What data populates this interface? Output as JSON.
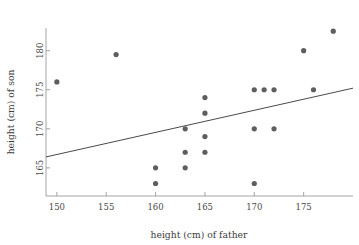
{
  "chart_data": {
    "type": "scatter",
    "title": "",
    "xlabel": "height (cm) of father",
    "ylabel": "height (cm) of son",
    "xlim": [
      148.9,
      180.0
    ],
    "ylim": [
      161.4,
      182.9
    ],
    "grid": false,
    "legend": "none",
    "xticks": [
      150,
      155,
      160,
      165,
      170,
      175
    ],
    "yticks": [
      165,
      170,
      175,
      180
    ],
    "xtick_labels": [
      "150",
      "155",
      "160",
      "165",
      "170",
      "175"
    ],
    "ytick_labels": [
      "165",
      "170",
      "175",
      "180"
    ],
    "point_color": "#5e5e5e",
    "line_color": "#4a4a4a",
    "axis_color": "#9a9a9a",
    "series": [
      {
        "name": "father-son heights",
        "x": [
          150,
          156,
          160,
          160,
          163,
          163,
          163,
          165,
          165,
          165,
          165,
          170,
          170,
          170,
          171,
          172,
          172,
          175,
          176,
          178
        ],
        "y": [
          176,
          179.5,
          165,
          163,
          170,
          167,
          165,
          174,
          172,
          169,
          167,
          175,
          170,
          163,
          175,
          175,
          170,
          180,
          175,
          182.5
        ]
      }
    ],
    "trend_line": {
      "name": "regression line",
      "x0": 148.9,
      "y0": 166.4,
      "x1": 180.0,
      "y1": 175.2
    }
  },
  "axes": {
    "x_title": "height (cm) of father",
    "y_title": "height (cm) of son"
  }
}
